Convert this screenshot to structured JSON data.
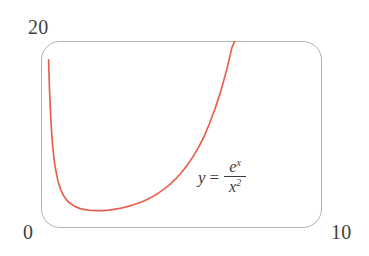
{
  "figure": {
    "background_color": "#ffffff",
    "frame": {
      "border_color": "#b2b2b2",
      "corner_radius_px": 19
    },
    "axes": {
      "y_max_label": "20",
      "x_min_label": "0",
      "x_max_label": "10"
    },
    "annotation": {
      "lhs": "y",
      "equals": "=",
      "numerator_base": "e",
      "numerator_exponent": "x",
      "denominator_base": "x",
      "denominator_exponent": "2",
      "plain_text": "y = e^x / x^2"
    }
  },
  "chart_data": {
    "type": "line",
    "title": "",
    "subtitle": "",
    "xlabel": "",
    "ylabel": "",
    "xlim": [
      0,
      10
    ],
    "ylim": [
      0,
      20
    ],
    "grid": false,
    "legend": null,
    "annotations": [
      {
        "text": "y = e^x / x^2",
        "x": 7.1,
        "y": 4.6
      }
    ],
    "tick_labels": {
      "x": [
        "0",
        "10"
      ],
      "y": [
        "0",
        "20"
      ]
    },
    "series": [
      {
        "name": "y = e^x / x^2",
        "color": "#e8604d",
        "line_width": 1.7,
        "function": "exp(x)/x^2",
        "minimum": {
          "x": 2,
          "y": 1.847
        },
        "x": [
          0.27,
          0.3,
          0.35,
          0.4,
          0.45,
          0.5,
          0.6,
          0.7,
          0.8,
          0.9,
          1.0,
          1.2,
          1.4,
          1.6,
          1.8,
          2.0,
          2.2,
          2.4,
          2.6,
          2.8,
          3.0,
          3.2,
          3.4,
          3.6,
          3.8,
          4.0,
          4.2,
          4.4,
          4.6,
          4.8,
          5.0,
          5.2,
          5.4,
          5.6,
          5.8,
          6.0,
          6.2,
          6.4,
          6.6,
          6.8,
          6.9
        ],
        "y": [
          17.98,
          15.01,
          11.59,
          9.33,
          7.75,
          6.59,
          5.06,
          4.11,
          3.48,
          3.04,
          2.72,
          2.31,
          2.07,
          1.94,
          1.87,
          1.85,
          1.86,
          1.91,
          1.99,
          2.09,
          2.23,
          2.4,
          2.59,
          2.81,
          3.07,
          3.41,
          3.78,
          4.21,
          4.7,
          5.27,
          5.94,
          6.7,
          7.58,
          8.59,
          9.76,
          11.2,
          12.8,
          14.66,
          16.83,
          19.35,
          20.0
        ]
      }
    ]
  }
}
